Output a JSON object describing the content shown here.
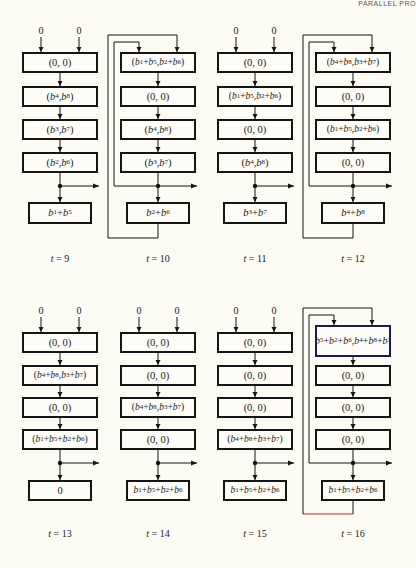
{
  "header": {
    "text": "PARALLEL PRO"
  },
  "input_label": "0",
  "panels": [
    {
      "time_label": "t = 9",
      "has_inputs": true,
      "has_feedback": false,
      "cells": [
        "(0, 0)",
        "(b4, b8)",
        "(b3, b7)",
        "(b2, b6)"
      ],
      "output": "b1 + b5"
    },
    {
      "time_label": "t = 10",
      "has_inputs": false,
      "has_feedback": true,
      "cells": [
        "(b1 + b5, b2 + b6)",
        "(0, 0)",
        "(b4, b8)",
        "(b3, b7)"
      ],
      "output": "b2 + b6"
    },
    {
      "time_label": "t = 11",
      "has_inputs": true,
      "has_feedback": false,
      "cells": [
        "(0, 0)",
        "(b1 + b5, b2 + b6)",
        "(0, 0)",
        "(b4, b8)"
      ],
      "output": "b3 + b7"
    },
    {
      "time_label": "t = 12",
      "has_inputs": false,
      "has_feedback": true,
      "cells": [
        "(b4 + b8, b3 + b7)",
        "(0, 0)",
        "(b1 + b5, b2 + b6)",
        "(0, 0)"
      ],
      "output": "b4 + b8"
    },
    {
      "time_label": "t = 13",
      "has_inputs": true,
      "has_feedback": false,
      "cells": [
        "(0, 0)",
        "(b4 + b8, b3 + b7)",
        "(0, 0)",
        "(b1 + b5 + b2 + b6)"
      ],
      "output": "0"
    },
    {
      "time_label": "t = 14",
      "has_inputs": true,
      "has_feedback": false,
      "cells": [
        "(0, 0)",
        "(0, 0)",
        "(b4 + b8, b3 + b7)",
        "(0, 0)"
      ],
      "output": "b1+b5+b2+b6"
    },
    {
      "time_label": "t = 15",
      "has_inputs": true,
      "has_feedback": false,
      "cells": [
        "(0, 0)",
        "(0, 0)",
        "(0, 0)",
        "(b4 + b8 + b3 + b7)"
      ],
      "output": "b1+b5+b2+b6"
    },
    {
      "time_label": "t = 16",
      "has_inputs": false,
      "has_feedback": true,
      "cells": [
        "(b1 + b5 + b2 + b6, b4 + b8 + b3 + b7)",
        "(0, 0)",
        "(0, 0)",
        "(0, 0)"
      ],
      "output": "b1 +b5 +b2+b6"
    }
  ],
  "colors": {
    "line": "#151515",
    "feedback_bottom_t16": "#c0282a",
    "tall_box_border": "#1c1c4a",
    "background": "#fbfaf3"
  }
}
